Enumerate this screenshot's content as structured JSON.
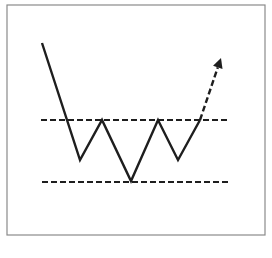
{
  "diagram": {
    "title": "",
    "pattern": "inverse head and shoulders",
    "colors": {
      "background": "#ffffff",
      "frame": "#8a8a8a",
      "line": "#1e1e1e"
    },
    "frame": {
      "x": 7,
      "y": 5,
      "width": 258,
      "height": 230
    },
    "price_path": [
      [
        42,
        43
      ],
      [
        80,
        160
      ],
      [
        102,
        120
      ],
      [
        131,
        181
      ],
      [
        158,
        120
      ],
      [
        178,
        160
      ],
      [
        200,
        120
      ]
    ],
    "breakout_projection": {
      "from": [
        200,
        120
      ],
      "to": [
        221,
        58
      ]
    },
    "neckline": {
      "y": 120,
      "x1": 41,
      "x2": 230
    },
    "support_line": {
      "y": 182,
      "x1": 42,
      "x2": 231
    }
  }
}
